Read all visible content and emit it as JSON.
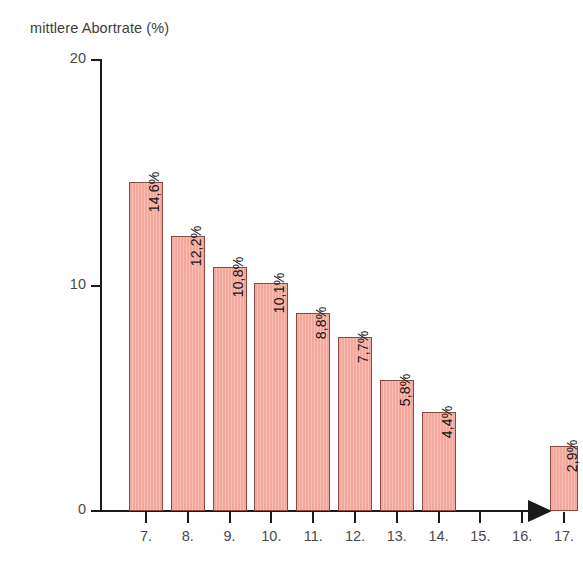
{
  "chart_data": {
    "type": "bar",
    "title": "mittlere Abortrate (%)",
    "xlabel": "",
    "ylabel": "mittlere Abortrate (%)",
    "ylim": [
      0,
      20
    ],
    "y_ticks": [
      0,
      10,
      20
    ],
    "y_tick_labels": [
      "0",
      "10",
      "20"
    ],
    "grid": false,
    "legend": null,
    "categories": [
      "7.",
      "8.",
      "9.",
      "10.",
      "11.",
      "12.",
      "13.",
      "14.",
      "15.",
      "16.",
      "17."
    ],
    "values": [
      14.6,
      12.2,
      10.8,
      10.1,
      8.8,
      7.7,
      5.8,
      4.4,
      null,
      null,
      2.9
    ],
    "data_labels": [
      "14,6%",
      "12,2%",
      "10,8%",
      "10,1%",
      "8,8%",
      "7,7%",
      "5,8%",
      "4,4%",
      "",
      "",
      "2,9%"
    ],
    "bar_color": "#f4a79b",
    "bar_border_color": "#8a4a44",
    "axis_color": "#1a1a1a",
    "text_color": "#4a4a4a",
    "background": "#ffffff"
  },
  "axis": {
    "y_label_20": "20",
    "y_label_10": "10",
    "y_label_0": "0"
  },
  "bars": [
    {
      "category": "7.",
      "label": "14,6%",
      "value": 14.6
    },
    {
      "category": "8.",
      "label": "12,2%",
      "value": 12.2
    },
    {
      "category": "9.",
      "label": "10,8%",
      "value": 10.8
    },
    {
      "category": "10.",
      "label": "10,1%",
      "value": 10.1
    },
    {
      "category": "11.",
      "label": "8,8%",
      "value": 8.8
    },
    {
      "category": "12.",
      "label": "7,7%",
      "value": 7.7
    },
    {
      "category": "13.",
      "label": "5,8%",
      "value": 5.8
    },
    {
      "category": "14.",
      "label": "4,4%",
      "value": 4.4
    },
    {
      "category": "15.",
      "label": "",
      "value": null
    },
    {
      "category": "16.",
      "label": "",
      "value": null
    },
    {
      "category": "17.",
      "label": "2,9%",
      "value": 2.9
    }
  ]
}
